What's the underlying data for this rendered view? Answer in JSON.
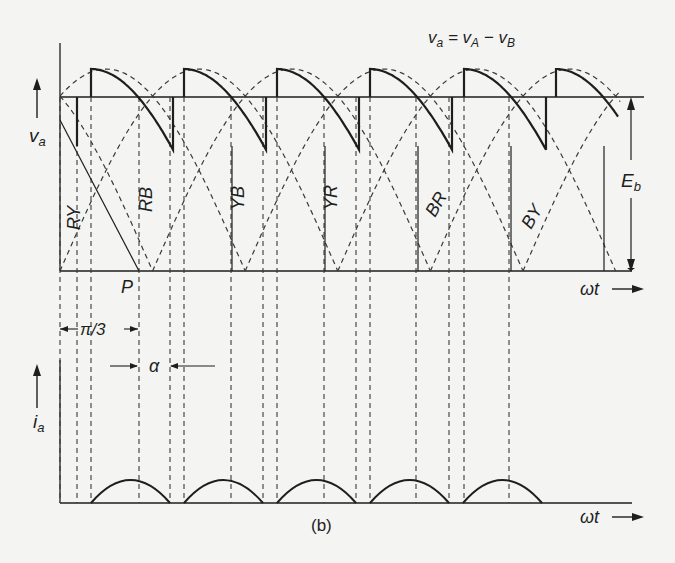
{
  "figure": {
    "caption": "(b)",
    "colors": {
      "ink": "#1e1e1e",
      "dash": "#3a3a3a",
      "paper": "#f4f4f2"
    }
  },
  "voltage_plot": {
    "equation": {
      "main": "v",
      "sub1": "a",
      "eq": " = v",
      "sub2": "A",
      "minus": " − v",
      "sub3": "B"
    },
    "y_label": {
      "main": "v",
      "sub": "a"
    },
    "x_label": "ωt",
    "point_label": "P",
    "eb_label": {
      "main": "E",
      "sub": "b"
    },
    "interval_label": "π/3",
    "alpha_label": "α",
    "line_voltage_labels": [
      "RY",
      "RB",
      "YB",
      "YR",
      "BR",
      "BY"
    ]
  },
  "current_plot": {
    "y_label": {
      "main": "i",
      "sub": "a"
    },
    "x_label": "ωt",
    "pulse_count": 5
  },
  "chart_data": {
    "type": "line",
    "xlabel": "ωt",
    "ylabel": "v_a , i_a",
    "period_per_segment": "π/3",
    "firing_delay": "α",
    "series": [
      {
        "name": "v_a (output voltage, solid)",
        "style": "solid"
      },
      {
        "name": "line voltages RY, RB, YB, YR, BR, BY",
        "style": "dashed"
      },
      {
        "name": "E_b (back emf level)",
        "style": "solid"
      },
      {
        "name": "i_a (armature current pulses)",
        "style": "solid",
        "pulses": 5
      }
    ]
  }
}
